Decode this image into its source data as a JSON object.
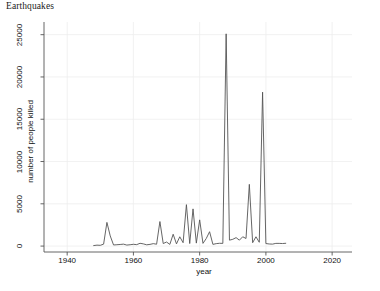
{
  "chart_data": {
    "type": "line",
    "title": "Earthquakes",
    "xlabel": "year",
    "ylabel": "number of people killed",
    "xlim": [
      1933,
      2026
    ],
    "ylim": [
      -700,
      26500
    ],
    "xticks": [
      1940,
      1960,
      1980,
      2000,
      2020
    ],
    "xtick_labels": [
      "1940",
      "1960",
      "1980",
      "2000",
      "2020"
    ],
    "yticks": [
      0,
      5000,
      10000,
      15000,
      20000,
      25000
    ],
    "ytick_labels": [
      "0",
      "5000",
      "10000",
      "15000",
      "20000",
      "25000"
    ],
    "grid": true,
    "legend": "none",
    "line_color": "#555555",
    "panel_bg": "#ffffff",
    "grid_color": "#eeeeee",
    "axis_color": "#555555",
    "series": [
      {
        "name": "number of people killed",
        "x": [
          1948,
          1949,
          1950,
          1951,
          1952,
          1953,
          1954,
          1955,
          1956,
          1957,
          1958,
          1959,
          1960,
          1961,
          1962,
          1963,
          1964,
          1965,
          1966,
          1967,
          1968,
          1969,
          1970,
          1971,
          1972,
          1973,
          1974,
          1975,
          1976,
          1977,
          1978,
          1979,
          1980,
          1981,
          1982,
          1983,
          1984,
          1985,
          1986,
          1987,
          1988,
          1989,
          1990,
          1991,
          1992,
          1993,
          1994,
          1995,
          1996,
          1997,
          1998,
          1999,
          2000,
          2001,
          2002,
          2003,
          2004,
          2005,
          2006
        ],
        "values": [
          60,
          110,
          90,
          230,
          2800,
          1200,
          130,
          160,
          190,
          230,
          120,
          160,
          210,
          170,
          330,
          260,
          150,
          200,
          290,
          220,
          2900,
          300,
          480,
          200,
          1400,
          260,
          1100,
          400,
          4900,
          300,
          4400,
          350,
          3100,
          320,
          900,
          1700,
          200,
          290,
          330,
          320,
          25100,
          700,
          800,
          1000,
          700,
          1100,
          900,
          7300,
          400,
          1100,
          450,
          18200,
          300,
          250,
          230,
          320,
          320,
          300,
          330
        ]
      }
    ]
  },
  "axis": {
    "x_title": "year",
    "y_title": "number of people killed"
  }
}
